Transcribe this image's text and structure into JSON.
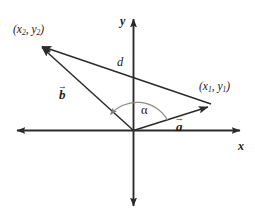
{
  "figure": {
    "type": "vector-diagram",
    "background_color": "#ffffff",
    "stroke_color": "#2b2b2b",
    "axes": {
      "x_label": "x",
      "y_label": "y",
      "origin_label": ""
    },
    "points": [
      {
        "name": "point-1",
        "base": "(x",
        "sub1": "1",
        "mid": ", y",
        "sub2": "1",
        "close": ")",
        "full_text": "(x1, y1)"
      },
      {
        "name": "point-2",
        "base": "(x",
        "sub1": "2",
        "mid": ", y",
        "sub2": "2",
        "close": ")",
        "full_text": "(x2, y2)"
      }
    ],
    "vectors": [
      {
        "name": "vector-a",
        "label": "a",
        "accent": "→",
        "to_point": "(x1, y1)"
      },
      {
        "name": "vector-b",
        "label": "b",
        "accent": "→",
        "to_point": "(x2, y2)"
      }
    ],
    "segments": [
      {
        "name": "distance-d",
        "label": "d",
        "from": "(x1, y1)",
        "to": "(x2, y2)"
      }
    ],
    "angles": [
      {
        "name": "angle-alpha",
        "label": "α",
        "between": [
          "vector-a",
          "vector-b"
        ]
      }
    ]
  }
}
